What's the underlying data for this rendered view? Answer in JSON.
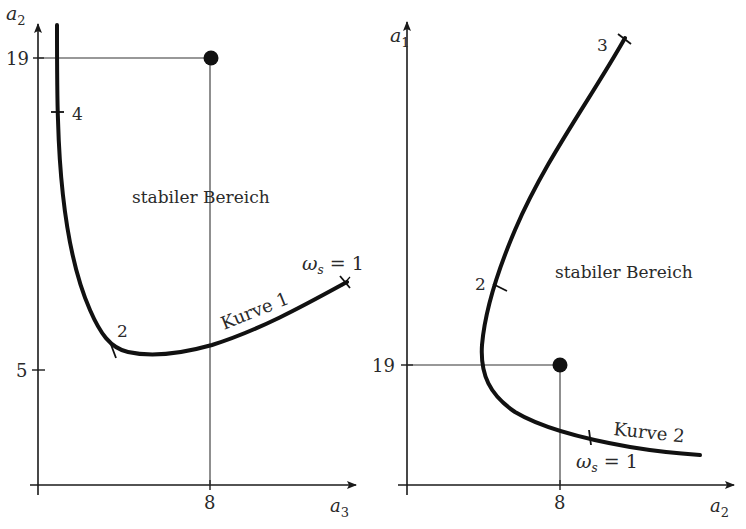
{
  "left_panel": {
    "y_axis_label": "a",
    "y_axis_sub": "2",
    "x_axis_label": "a",
    "x_axis_sub": "3",
    "y_ticks": [
      "19",
      "5"
    ],
    "x_ticks": [
      "8"
    ],
    "region_label": "stabiler Bereich",
    "curve_label": "Kurve 1",
    "curve_marks": [
      "4",
      "2"
    ],
    "omega_label_symbol": "ω",
    "omega_label_sub": "s",
    "omega_label_rest": " = 1",
    "point": {
      "x": "8",
      "y": "19"
    }
  },
  "right_panel": {
    "y_axis_label": "a",
    "y_axis_sub": "1",
    "x_axis_label": "a",
    "x_axis_sub": "2",
    "y_ticks": [
      "19"
    ],
    "x_ticks": [
      "8"
    ],
    "region_label": "stabiler Bereich",
    "curve_label": "Kurve 2",
    "curve_marks": [
      "3",
      "2"
    ],
    "omega_label_symbol": "ω",
    "omega_label_sub": "s",
    "omega_label_rest": " = 1",
    "point": {
      "x": "8",
      "y": "19"
    }
  },
  "colors": {
    "ink": "#1a1a1a",
    "thin_line": "#333333",
    "background": "#ffffff"
  }
}
